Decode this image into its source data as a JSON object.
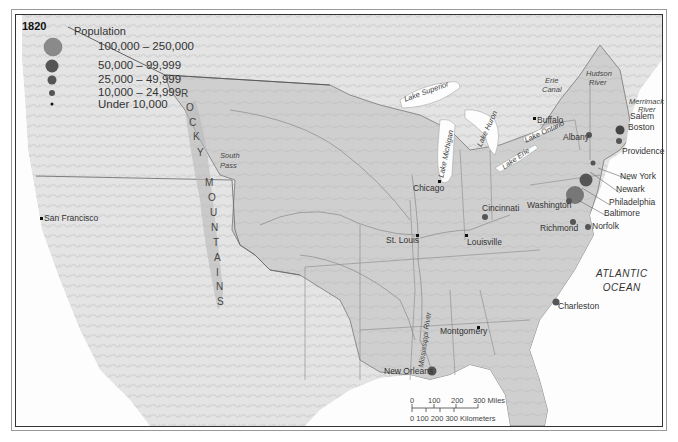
{
  "map": {
    "year": "1820",
    "legend": {
      "title": "Population",
      "items": [
        {
          "label": "100,000 – 250,000",
          "size": 9
        },
        {
          "label": "50,000 – 99,999",
          "size": 6.5
        },
        {
          "label": "25,000 – 49,999",
          "size": 4.5
        },
        {
          "label": "10,000 – 24,999",
          "size": 3
        },
        {
          "label": "Under 10,000",
          "size": 1.5
        }
      ]
    },
    "cities": [
      {
        "name": "San Francisco",
        "x": 41,
        "y": 218,
        "size": "under-10000"
      },
      {
        "name": "Chicago",
        "x": 440,
        "y": 181,
        "size": "under-10000"
      },
      {
        "name": "St. Louis",
        "x": 417,
        "y": 235,
        "size": "under-10000"
      },
      {
        "name": "Louisville",
        "x": 466,
        "y": 235,
        "size": "under-10000"
      },
      {
        "name": "Cincinnati",
        "x": 485,
        "y": 216,
        "size": "10000-24999"
      },
      {
        "name": "Buffalo",
        "x": 534,
        "y": 118,
        "size": "under-10000"
      },
      {
        "name": "Albany",
        "x": 589,
        "y": 136,
        "size": "10000-24999"
      },
      {
        "name": "Salem",
        "x": 617,
        "y": 126,
        "size": "10000-24999"
      },
      {
        "name": "Boston",
        "x": 620,
        "y": 130,
        "size": "25000-49999"
      },
      {
        "name": "Providence",
        "x": 619,
        "y": 140,
        "size": "10000-24999"
      },
      {
        "name": "New York",
        "x": 587,
        "y": 184,
        "size": "100000-250000"
      },
      {
        "name": "Newark",
        "x": 593,
        "y": 164,
        "size": "under-10000"
      },
      {
        "name": "Philadelphia",
        "x": 576,
        "y": 194,
        "size": "100000-250000"
      },
      {
        "name": "Baltimore",
        "x": 572,
        "y": 201,
        "size": "50000-99999"
      },
      {
        "name": "Washington",
        "x": 569,
        "y": 203,
        "size": "10000-24999"
      },
      {
        "name": "Richmond",
        "x": 572,
        "y": 222,
        "size": "10000-24999"
      },
      {
        "name": "Norfolk",
        "x": 588,
        "y": 227,
        "size": "10000-24999"
      },
      {
        "name": "Charleston",
        "x": 556,
        "y": 302,
        "size": "25000-49999"
      },
      {
        "name": "Montgomery",
        "x": 478,
        "y": 327,
        "size": "under-10000"
      },
      {
        "name": "New Orleans",
        "x": 431,
        "y": 371,
        "size": "25000-49999"
      }
    ],
    "features": {
      "lake_superior": "Lake Superior",
      "lake_michigan": "Lake Michigan",
      "lake_huron": "Lake Huron",
      "lake_erie": "Lake Erie",
      "lake_ontario": "Lake Ontario",
      "erie_canal_1": "Erie",
      "erie_canal_2": "Canal",
      "hudson_1": "Hudson",
      "hudson_2": "River",
      "merrimack_1": "Merrimack",
      "merrimack_2": "River",
      "mississippi": "Mississippi River",
      "south_pass_1": "South",
      "south_pass_2": "Pass",
      "rocky_mountains": "ROCKY MOUNTAINS",
      "ocean_1": "ATLANTIC",
      "ocean_2": "OCEAN"
    },
    "scale": {
      "miles_ticks": [
        "0",
        "100",
        "200",
        "300 Miles"
      ],
      "km_ticks": "0  100 200 300 Kilometers"
    }
  }
}
